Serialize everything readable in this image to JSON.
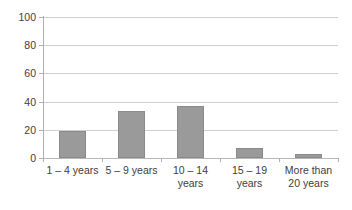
{
  "chart_data": {
    "type": "bar",
    "title": "",
    "subtitle": "",
    "xlabel": "",
    "ylabel": "",
    "categories": [
      "1 – 4 years",
      "5 – 9 years",
      "10 – 14 years",
      "15 – 19 years",
      "More than 20 years"
    ],
    "values": [
      19,
      33,
      37,
      7,
      3
    ],
    "ylim": [
      0,
      100
    ],
    "yticks": [
      0,
      20,
      40,
      60,
      80,
      100
    ],
    "ytick_labels": [
      "0",
      "20",
      "40",
      "60",
      "80",
      "100"
    ],
    "grid": "horizontal",
    "legend": "none",
    "series": [
      {
        "name": "",
        "values": [
          19,
          33,
          37,
          7,
          3
        ],
        "color": "#9a9a9a"
      }
    ],
    "colors": {
      "bar_fill": "#9a9a9a",
      "bar_border": "#8a8a8a",
      "gridline": "#cfcfcf",
      "axis": "#b0b0b0",
      "text": "#3d3d3d",
      "background": "#ffffff"
    }
  },
  "axes": {
    "y": {
      "ticks": [
        {
          "label": "100",
          "value": 100
        },
        {
          "label": "80",
          "value": 80
        },
        {
          "label": "60",
          "value": 60
        },
        {
          "label": "40",
          "value": 40
        },
        {
          "label": "20",
          "value": 20
        },
        {
          "label": "0",
          "value": 0
        }
      ]
    },
    "x": {
      "ticks": [
        {
          "label": "1 – 4 years"
        },
        {
          "label": "5 – 9 years"
        },
        {
          "label": "10 – 14 years"
        },
        {
          "label": "15 – 19 years"
        },
        {
          "label": "More than 20 years"
        }
      ]
    }
  },
  "bars": [
    {
      "label": "1 – 4 years",
      "value": 19
    },
    {
      "label": "5 – 9 years",
      "value": 33
    },
    {
      "label": "10 – 14 years",
      "value": 37
    },
    {
      "label": "15 – 19 years",
      "value": 7
    },
    {
      "label": "More than 20 years",
      "value": 3
    }
  ]
}
